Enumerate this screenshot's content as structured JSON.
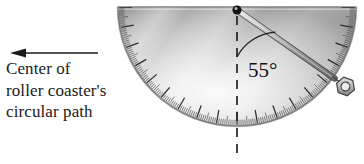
{
  "figure": {
    "annotation": {
      "arrow_direction": "left",
      "arrow_icon": "left-arrow-icon",
      "caption_lines": [
        "Center of",
        "roller coaster's",
        "circular path"
      ]
    },
    "protractor": {
      "shape": "semicircle-flat-top",
      "center_x": 237,
      "center_y": 7,
      "radius": 119,
      "tick_count_major": 18,
      "tick_count_minor": 180,
      "body_color_light": "#f2f2f2",
      "body_color_mid": "#c9c9c9",
      "body_color_dark": "#8f8f8f",
      "edge_color": "#6e6e6e"
    },
    "pivot": {
      "label": "pivot-point",
      "color": "#1a1a1a"
    },
    "plumb_arm": {
      "label": "pointer-arm",
      "angle_from_vertical_deg": 55,
      "color": "#9a9a9a",
      "outline_color": "#4a4a4a"
    },
    "bob": {
      "label": "hex-nut-weight",
      "shape": "hexagon",
      "color": "#bdbdbd",
      "outline_color": "#4a4a4a"
    },
    "vertical_reference": {
      "label": "dashed-vertical-line",
      "style": "dashed",
      "color": "#222222"
    },
    "angle_measure": {
      "value_label": "55°",
      "arc_color": "#1a1a1a",
      "text_color": "#111111"
    }
  }
}
